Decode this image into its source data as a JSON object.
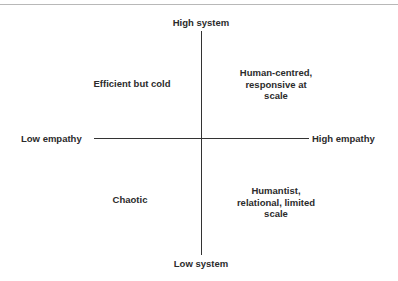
{
  "diagram": {
    "type": "quadrant-matrix",
    "axes": {
      "vertical": {
        "top_label": "High system",
        "bottom_label": "Low system"
      },
      "horizontal": {
        "left_label": "Low empathy",
        "right_label": "High empathy"
      }
    },
    "quadrants": {
      "top_left": "Efficient but cold",
      "top_right": [
        "Human-centred,",
        "responsive at",
        "scale"
      ],
      "bottom_left": "Chaotic",
      "bottom_right": [
        "Humantist,",
        "relational, limited",
        "scale"
      ]
    },
    "colors": {
      "text": "#2b2b2b",
      "axis": "#333333",
      "top_rule": "#b8b8b8",
      "background": "#ffffff"
    }
  }
}
